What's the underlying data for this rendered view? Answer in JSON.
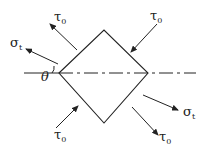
{
  "diagram": {
    "type": "stress-element",
    "colors": {
      "line": "#222222",
      "background": "#ffffff"
    },
    "element": {
      "shape": "square rotated 45°",
      "vertices": {
        "left": [
          59,
          73
        ],
        "top": [
          104,
          30
        ],
        "right": [
          148,
          73
        ],
        "bottom": [
          104,
          123
        ]
      }
    },
    "axis": {
      "style": "dash-dot",
      "y": 73
    },
    "angle_label": {
      "text": "θ"
    },
    "labels": {
      "sigma_left": {
        "main": "σ",
        "sub": "t"
      },
      "sigma_right": {
        "main": "σ",
        "sub": "t"
      },
      "tau_top_left": {
        "main": "τ",
        "sub": "0"
      },
      "tau_top_right": {
        "main": "τ",
        "sub": "0"
      },
      "tau_bottom_left": {
        "main": "τ",
        "sub": "0"
      },
      "tau_bottom_right": {
        "main": "τ",
        "sub": "0"
      }
    }
  }
}
